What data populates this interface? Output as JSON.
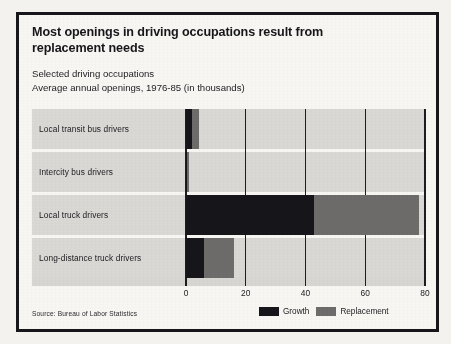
{
  "chart_data": {
    "type": "bar",
    "orientation": "horizontal",
    "stacked": true,
    "title": "Most openings in driving occupations result from replacement needs",
    "subtitle_lines": [
      "Selected driving occupations",
      "Average annual openings, 1976-85 (in thousands)"
    ],
    "xlabel": "",
    "ylabel": "",
    "xlim": [
      0,
      80
    ],
    "ticks": [
      0,
      20,
      40,
      60,
      80
    ],
    "tick_labels": [
      "0",
      "20",
      "40",
      "60",
      "80"
    ],
    "grid": true,
    "legend_position": "bottom-right",
    "categories": [
      "Local transit bus drivers",
      "Intercity bus drivers",
      "Local truck drivers",
      "Long-distance truck drivers"
    ],
    "series": [
      {
        "name": "Growth",
        "color": "#161519",
        "values": [
          2,
          0.5,
          43,
          6
        ]
      },
      {
        "name": "Replacement",
        "color": "#6d6c6a",
        "values": [
          2.5,
          0.5,
          35,
          10
        ]
      }
    ],
    "totals": [
      4.5,
      1,
      78,
      16
    ],
    "source": "Source: Bureau of Labor Statistics"
  },
  "legend": {
    "growth_label": "Growth",
    "replacement_label": "Replacement"
  },
  "colors": {
    "growth": "#161519",
    "replacement": "#6d6c6a",
    "panel": "#d9d8d4",
    "page": "#f7f6f2",
    "ink": "#17161a"
  }
}
